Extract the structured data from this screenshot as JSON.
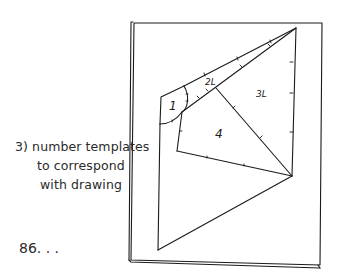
{
  "caption": {
    "line1": "3)  number templates",
    "line2": "to correspond",
    "line3": "with drawing"
  },
  "page_number": "86. . .",
  "diagram": {
    "labels": {
      "piece1": "1",
      "piece2": "2L",
      "piece3": "3L",
      "piece4": "4"
    }
  },
  "colors": {
    "ink": "#1a1a1a",
    "background": "#ffffff"
  }
}
